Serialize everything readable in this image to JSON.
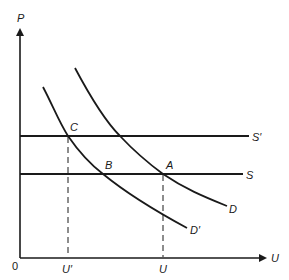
{
  "diagram": {
    "type": "supply-demand",
    "axes": {
      "y_label": "P",
      "x_label": "U",
      "origin_label": "0"
    },
    "x_ticks": [
      {
        "label": "U′",
        "x": 67
      },
      {
        "label": "U",
        "x": 163
      }
    ],
    "lines": [
      {
        "id": "S_prime",
        "label": "S′",
        "kind": "horizontal"
      },
      {
        "id": "S",
        "label": "S",
        "kind": "horizontal"
      }
    ],
    "curves": [
      {
        "id": "D",
        "label": "D",
        "kind": "downward-sloping"
      },
      {
        "id": "D_prime",
        "label": "D′",
        "kind": "downward-sloping"
      }
    ],
    "points": [
      {
        "label": "A",
        "on": [
          "S",
          "D"
        ]
      },
      {
        "label": "B",
        "on": [
          "S",
          "D_prime"
        ]
      },
      {
        "label": "C",
        "on": [
          "S_prime",
          "D_prime"
        ]
      }
    ],
    "stroke_color": "#1a1a1a",
    "background": "#ffffff"
  }
}
